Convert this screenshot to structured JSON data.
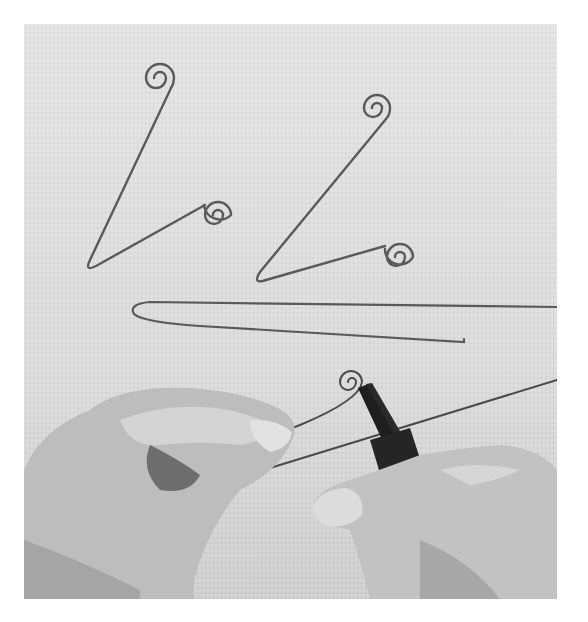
{
  "image": {
    "description": "Black-and-white photograph of hands bending wire with round-nose pliers; finished wire hooks with spiral ends on a textured surface",
    "colors": {
      "background": "#ffffff",
      "surface": "#dddddd",
      "wire": "#5a5a5a",
      "skin_light": "#cfcfcf",
      "skin_shadow": "#8a8a8a",
      "pliers": "#1e1e1e"
    }
  }
}
